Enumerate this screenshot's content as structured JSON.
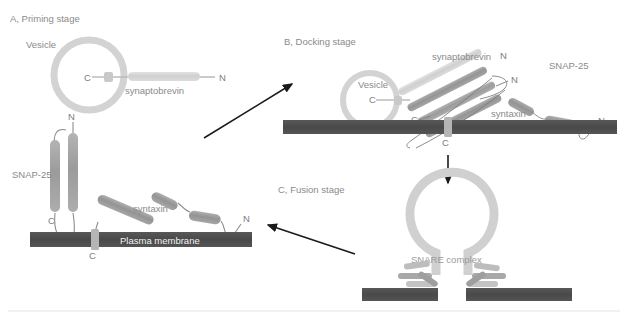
{
  "figure": {
    "background_color": "#ffffff",
    "bottom_rule_color": "#ededed"
  },
  "palette": {
    "vesicle_gray": "#d2d2d2",
    "synaptobrevin_light": "#d4d4d4",
    "syntaxin_mid": "#a3a3a3",
    "snap25_mid": "#9e9e9e",
    "membrane_dark": "#4d4d4d",
    "line_gray": "#8d8d8d",
    "arrow_black": "#1a1a1a",
    "text_gray": "#8a8a8a",
    "membrane_text": "#f2f2f2"
  },
  "panels": {
    "a": {
      "title": "A, Priming stage",
      "vesicle_label": "Vesicle",
      "synaptobrevin_label": "synaptobrevin",
      "synaptobrevin_c": "C",
      "synaptobrevin_n": "N",
      "snap25_label": "SNAP-25",
      "snap25_n": "N",
      "snap25_c": "C",
      "syntaxin_label": "syntaxin",
      "syntaxin_n": "N",
      "syntaxin_c": "C",
      "membrane_label": "Plasma membrane"
    },
    "b": {
      "title": "B, Docking stage",
      "vesicle_label": "Vesicle",
      "vesicle_c": "C",
      "synaptobrevin_label": "synaptobrevin",
      "synaptobrevin_n": "N",
      "bundle_c": "C",
      "bundle_n": "N",
      "snap25_label": "SNAP-25",
      "syntaxin_label": "syntaxin",
      "syntaxin_n": "N",
      "syntaxin_c": "C"
    },
    "c": {
      "title": "C, Fusion stage",
      "snare_complex_label": "SNARE complex"
    }
  },
  "arrows": [
    {
      "name": "arrow-a-to-b",
      "from": "A, Priming stage",
      "to": "B, Docking stage"
    },
    {
      "name": "arrow-b-to-c",
      "from": "B, Docking stage",
      "to": "C, Fusion stage"
    },
    {
      "name": "arrow-c-to-a",
      "from": "C, Fusion stage",
      "to": "A, Priming stage"
    }
  ]
}
